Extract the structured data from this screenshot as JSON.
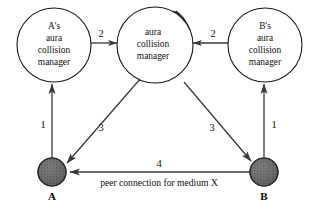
{
  "diagram": {
    "background_color": "#ffffff",
    "stroke_color": "#1a1a1a",
    "node_fill_color": "#6b6b6b",
    "nodes": {
      "left_manager": {
        "name": "A's aura collision manager",
        "lines": [
          "A's",
          "aura",
          "collision",
          "manager"
        ],
        "line1": "A's",
        "line2": "aura",
        "line3": "collision",
        "line4": "manager"
      },
      "center_manager": {
        "name": "aura collision manager",
        "lines": [
          "aura",
          "collision",
          "manager"
        ],
        "line1": "aura",
        "line2": "collision",
        "line3": "manager",
        "stack_count": 4
      },
      "right_manager": {
        "name": "B's aura collision manager",
        "lines": [
          "B's",
          "aura",
          "collision",
          "manager"
        ],
        "line1": "B's",
        "line2": "aura",
        "line3": "collision",
        "line4": "manager"
      },
      "host_a": {
        "label": "A"
      },
      "host_b": {
        "label": "B"
      }
    },
    "edge_labels": {
      "a_to_left_manager": "1",
      "left_manager_to_center": "2",
      "center_to_host_a": "3",
      "center_to_host_b": "3",
      "right_manager_to_center": "2",
      "b_to_right_manager": "1",
      "peer_connection_number": "4"
    },
    "captions": {
      "peer_connection": "peer connection for medium X"
    }
  }
}
